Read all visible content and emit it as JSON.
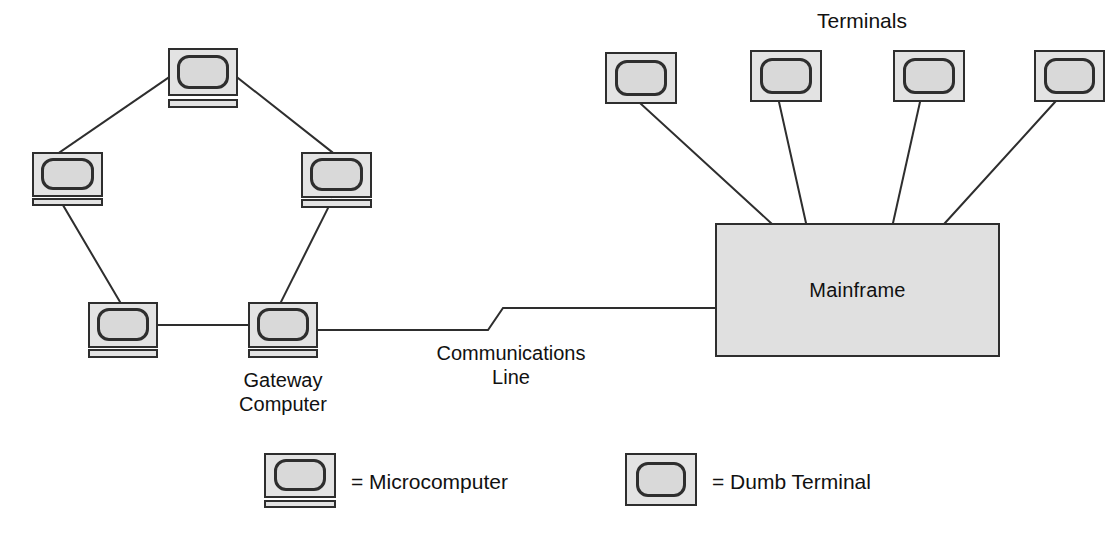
{
  "diagram": {
    "title_terminals": "Terminals",
    "mainframe_label": "Mainframe",
    "gateway_label": "Gateway\nComputer",
    "comm_line_label": "Communications\nLine",
    "legend": {
      "micro": "= Microcomputer",
      "terminal": "= Dumb Terminal"
    },
    "colors": {
      "line": "#2e2e2e",
      "device_fill": "#e3e3e3",
      "screen_fill": "#d9d9d9",
      "mainframe_fill": "#e0e0e0",
      "text": "#111111",
      "background": "#ffffff"
    },
    "ring_nodes": [
      {
        "name": "micro-top",
        "x": 168,
        "y": 48,
        "w": 70,
        "h": 48
      },
      {
        "name": "micro-left",
        "x": 32,
        "y": 152,
        "w": 70,
        "h": 45
      },
      {
        "name": "micro-right",
        "x": 301,
        "y": 152,
        "w": 71,
        "h": 46
      },
      {
        "name": "micro-bottom-left",
        "x": 88,
        "y": 302,
        "w": 70,
        "h": 46
      },
      {
        "name": "gateway-computer",
        "x": 248,
        "y": 302,
        "w": 70,
        "h": 46
      }
    ],
    "terminal_nodes": [
      {
        "name": "terminal-1",
        "x": 605,
        "y": 52,
        "w": 72,
        "h": 52
      },
      {
        "name": "terminal-2",
        "x": 750,
        "y": 50,
        "w": 72,
        "h": 52
      },
      {
        "name": "terminal-3",
        "x": 893,
        "y": 50,
        "w": 72,
        "h": 52
      },
      {
        "name": "terminal-4",
        "x": 1034,
        "y": 50,
        "w": 71,
        "h": 52
      }
    ],
    "mainframe": {
      "x": 715,
      "y": 223,
      "w": 285,
      "h": 134
    },
    "ring_links": [
      "micro-left -> micro-top",
      "micro-top -> micro-right",
      "micro-left -> micro-bottom-left",
      "micro-right -> gateway-computer",
      "micro-bottom-left -> gateway-computer"
    ],
    "terminal_links": [
      "terminal-1 -> mainframe",
      "terminal-2 -> mainframe",
      "terminal-3 -> mainframe",
      "terminal-4 -> mainframe"
    ],
    "comm_link": "gateway-computer -> mainframe"
  }
}
